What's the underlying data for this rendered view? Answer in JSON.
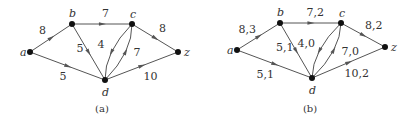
{
  "graphs": [
    {
      "id": "a",
      "caption": "(a)",
      "nodes": [
        "a",
        "b",
        "c",
        "d",
        "z"
      ],
      "edges": [
        {
          "from": "a",
          "to": "b",
          "label": "8"
        },
        {
          "from": "a",
          "to": "d",
          "label": "5"
        },
        {
          "from": "b",
          "to": "c",
          "label": "7"
        },
        {
          "from": "b",
          "to": "d",
          "label": "5"
        },
        {
          "from": "c",
          "to": "d",
          "label": "4"
        },
        {
          "from": "d",
          "to": "c",
          "label": "7"
        },
        {
          "from": "c",
          "to": "z",
          "label": "8"
        },
        {
          "from": "d",
          "to": "z",
          "label": "10"
        }
      ]
    },
    {
      "id": "b",
      "caption": "(b)",
      "nodes": [
        "a",
        "b",
        "c",
        "d",
        "z"
      ],
      "edges": [
        {
          "from": "a",
          "to": "b",
          "label": "8,3"
        },
        {
          "from": "a",
          "to": "d",
          "label": "5,1"
        },
        {
          "from": "b",
          "to": "c",
          "label": "7,2"
        },
        {
          "from": "b",
          "to": "d",
          "label": "5,1"
        },
        {
          "from": "c",
          "to": "d",
          "label": "4,0"
        },
        {
          "from": "d",
          "to": "c",
          "label": "7,0"
        },
        {
          "from": "c",
          "to": "z",
          "label": "8,2"
        },
        {
          "from": "d",
          "to": "z",
          "label": "10,2"
        }
      ]
    }
  ]
}
